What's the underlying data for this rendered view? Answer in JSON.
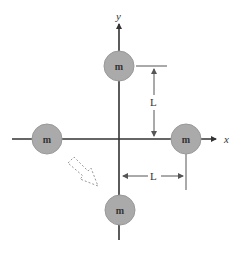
{
  "diagram": {
    "axes": {
      "x_label": "x",
      "y_label": "y"
    },
    "masses": [
      {
        "id": "top",
        "label": "m",
        "cx": 119,
        "cy": 66
      },
      {
        "id": "left",
        "label": "m",
        "cx": 47,
        "cy": 139
      },
      {
        "id": "right",
        "label": "m",
        "cx": 186,
        "cy": 139
      },
      {
        "id": "bottom",
        "label": "m",
        "cx": 120,
        "cy": 210
      }
    ],
    "dimensions": {
      "vertical_label": "L",
      "horizontal_label": "L"
    },
    "colors": {
      "mass_fill": "#aaaaaa",
      "mass_stroke": "#999999",
      "line": "#333333",
      "dim_line": "#555555",
      "dashed_arrow": "#999999"
    }
  }
}
